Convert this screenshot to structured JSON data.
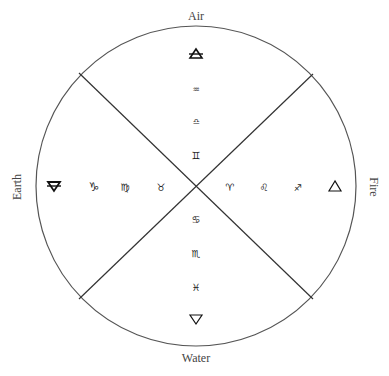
{
  "diagram": {
    "type": "elemental zodiac wheel",
    "circle": {
      "cx": 196,
      "cy": 186,
      "r": 160
    },
    "dividers": "diagonal cross dividing circle into four quadrants",
    "elements": {
      "air": {
        "label": "Air",
        "element_symbol": "🜁",
        "element_symbol_name": "air-triangle-icon",
        "signs": [
          "♒",
          "♎",
          "♊"
        ],
        "sign_names": [
          "Aquarius",
          "Libra",
          "Gemini"
        ]
      },
      "earth": {
        "label": "Earth",
        "element_symbol": "🜃",
        "element_symbol_name": "earth-triangle-icon",
        "signs": [
          "♑",
          "♍",
          "♉"
        ],
        "sign_names": [
          "Capricorn",
          "Virgo",
          "Taurus"
        ]
      },
      "fire": {
        "label": "Fire",
        "element_symbol": "🜂",
        "element_symbol_name": "fire-triangle-icon",
        "signs": [
          "♈",
          "♌",
          "♐"
        ],
        "sign_names": [
          "Aries",
          "Leo",
          "Sagittarius"
        ]
      },
      "water": {
        "label": "Water",
        "element_symbol": "🜄",
        "element_symbol_name": "water-triangle-icon",
        "signs": [
          "♋",
          "♏",
          "♓"
        ],
        "sign_names": [
          "Cancer",
          "Scorpio",
          "Pisces"
        ]
      }
    }
  }
}
